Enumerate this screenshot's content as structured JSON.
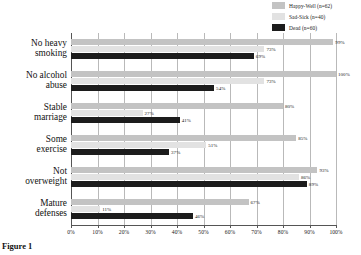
{
  "chart_data": {
    "type": "bar",
    "orientation": "horizontal",
    "title": "",
    "xlabel": "",
    "ylabel": "",
    "xlim": [
      0,
      100
    ],
    "xticks": [
      "0%",
      "10%",
      "20%",
      "30%",
      "40%",
      "50%",
      "60%",
      "70%",
      "80%",
      "90%",
      "100%"
    ],
    "grid": true,
    "legend_position": "top-right",
    "categories": [
      "No heavy smoking",
      "No alcohol abuse",
      "Stable marriage",
      "Some exercise",
      "Not overweight",
      "Mature defenses"
    ],
    "series": [
      {
        "name": "Happy-Well (n=62)",
        "color": "#c3c3c3",
        "values": [
          99,
          100,
          80,
          85,
          93,
          67
        ],
        "labels": [
          "99%",
          "100%",
          "80%",
          "85%",
          "93%",
          "67%"
        ]
      },
      {
        "name": "Sad-Sick (n=40)",
        "color": "#e2e2e2",
        "values": [
          73,
          73,
          27,
          51,
          86,
          11
        ],
        "labels": [
          "73%",
          "73%",
          "27%",
          "51%",
          "86%",
          "11%"
        ]
      },
      {
        "name": "Dead (n=60)",
        "color": "#1c1c1c",
        "values": [
          69,
          54,
          41,
          37,
          89,
          46
        ],
        "labels": [
          "69%",
          "54%",
          "41%",
          "37%",
          "89%",
          "46%"
        ]
      }
    ]
  },
  "categories_display": [
    {
      "line1": "No heavy",
      "line2": "smoking"
    },
    {
      "line1": "No alcohol",
      "line2": "abuse"
    },
    {
      "line1": "Stable",
      "line2": "marriage"
    },
    {
      "line1": "Some",
      "line2": "exercise"
    },
    {
      "line1": "Not",
      "line2": "overweight"
    },
    {
      "line1": "Mature",
      "line2": "defenses"
    }
  ],
  "caption": "Figure 1"
}
